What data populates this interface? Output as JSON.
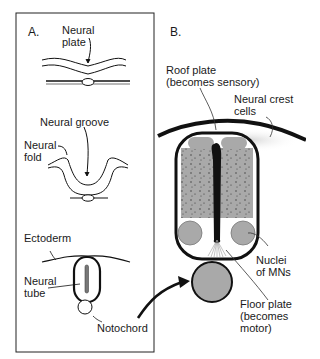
{
  "panels": {
    "a": {
      "label": "A.",
      "stages": {
        "neural_plate": "Neural\nplate",
        "neural_groove": "Neural groove",
        "neural_fold": "Neural\nfold",
        "ectoderm": "Ectoderm",
        "neural_tube": "Neural\ntube",
        "notochord": "Notochord"
      }
    },
    "b": {
      "label": "B.",
      "labels": {
        "roof_plate": "Roof plate\n(becomes sensory)",
        "neural_crest": "Neural crest\ncells",
        "nuclei_mns": "Nuclei\nof MNs",
        "floor_plate": "Floor plate\n(becomes\nmotor)"
      }
    }
  },
  "colors": {
    "outline": "#111111",
    "gray_fill": "#a9a9a9",
    "speckle": "#333333",
    "box_border": "#222222"
  }
}
